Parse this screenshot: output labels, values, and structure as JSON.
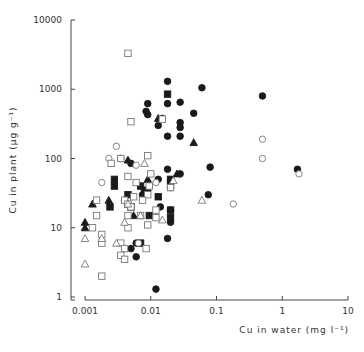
{
  "chart_data": {
    "type": "scatter",
    "title": "",
    "xlabel": "Cu in water (mg l⁻¹)",
    "ylabel": "Cu in plant (μg g⁻¹)",
    "xscale": "log",
    "yscale": "log",
    "xlim": [
      0.001,
      10
    ],
    "ylim": [
      1,
      10000
    ],
    "xticks": [
      "0.001",
      "0.01",
      "0.1",
      "1",
      "10"
    ],
    "yticks": [
      "1",
      "10",
      "100",
      "1000",
      "10000"
    ],
    "grid": false,
    "legend": "none",
    "series": [
      {
        "name": "filled-circle",
        "marker": "circle",
        "filled": true,
        "points": [
          [
            0.018,
            1300
          ],
          [
            0.06,
            1050
          ],
          [
            0.5,
            800
          ],
          [
            0.009,
            620
          ],
          [
            0.018,
            620
          ],
          [
            0.028,
            650
          ],
          [
            0.0085,
            480
          ],
          [
            0.009,
            430
          ],
          [
            0.015,
            380
          ],
          [
            0.028,
            330
          ],
          [
            0.028,
            280
          ],
          [
            0.013,
            300
          ],
          [
            0.018,
            210
          ],
          [
            0.028,
            210
          ],
          [
            0.045,
            450
          ],
          [
            0.0035,
            100
          ],
          [
            0.005,
            85
          ],
          [
            0.018,
            70
          ],
          [
            0.013,
            50
          ],
          [
            0.028,
            60
          ],
          [
            0.08,
            75
          ],
          [
            1.7,
            70
          ],
          [
            0.008,
            35
          ],
          [
            0.004,
            25
          ],
          [
            0.0075,
            30
          ],
          [
            0.075,
            30
          ],
          [
            0.014,
            20
          ],
          [
            0.02,
            18
          ],
          [
            0.02,
            12
          ],
          [
            0.018,
            7
          ],
          [
            0.006,
            6
          ],
          [
            0.005,
            5
          ],
          [
            0.006,
            3.8
          ],
          [
            0.012,
            1.3
          ],
          [
            0.02,
            38
          ],
          [
            0.009,
            35
          ]
        ]
      },
      {
        "name": "filled-square",
        "marker": "square",
        "filled": true,
        "points": [
          [
            0.018,
            850
          ],
          [
            0.0028,
            50
          ],
          [
            0.0028,
            40
          ],
          [
            0.007,
            40
          ],
          [
            0.0045,
            30
          ],
          [
            0.013,
            28
          ],
          [
            0.02,
            50
          ],
          [
            0.02,
            45
          ],
          [
            0.0024,
            20
          ],
          [
            0.005,
            20
          ],
          [
            0.0095,
            15
          ],
          [
            0.02,
            18
          ],
          [
            0.02,
            14
          ],
          [
            0.007,
            6
          ]
        ]
      },
      {
        "name": "filled-triangle",
        "marker": "triangle",
        "filled": true,
        "points": [
          [
            0.013,
            380
          ],
          [
            0.045,
            170
          ],
          [
            0.0045,
            95
          ],
          [
            0.009,
            50
          ],
          [
            0.025,
            60
          ],
          [
            0.0023,
            25
          ],
          [
            0.0013,
            22
          ],
          [
            0.0045,
            22
          ],
          [
            0.0055,
            15
          ],
          [
            0.001,
            12
          ],
          [
            0.001,
            10
          ]
        ]
      },
      {
        "name": "open-circle",
        "marker": "circle",
        "filled": false,
        "points": [
          [
            0.5,
            190
          ],
          [
            0.5,
            100
          ],
          [
            1.8,
            60
          ],
          [
            0.18,
            22
          ],
          [
            0.003,
            150
          ],
          [
            0.0023,
            100
          ],
          [
            0.006,
            80
          ],
          [
            0.0018,
            45
          ],
          [
            0.0065,
            6
          ],
          [
            0.012,
            45
          ]
        ]
      },
      {
        "name": "open-square",
        "marker": "square",
        "filled": false,
        "points": [
          [
            0.0045,
            3300
          ],
          [
            0.015,
            370
          ],
          [
            0.005,
            340
          ],
          [
            0.009,
            110
          ],
          [
            0.0035,
            100
          ],
          [
            0.0025,
            85
          ],
          [
            0.01,
            60
          ],
          [
            0.0045,
            55
          ],
          [
            0.006,
            45
          ],
          [
            0.0095,
            40
          ],
          [
            0.02,
            38
          ],
          [
            0.0055,
            28
          ],
          [
            0.0015,
            25
          ],
          [
            0.004,
            25
          ],
          [
            0.0045,
            22
          ],
          [
            0.005,
            20
          ],
          [
            0.009,
            30
          ],
          [
            0.0075,
            25
          ],
          [
            0.0045,
            15
          ],
          [
            0.007,
            15
          ],
          [
            0.0015,
            15
          ],
          [
            0.012,
            18
          ],
          [
            0.012,
            14
          ],
          [
            0.0045,
            10
          ],
          [
            0.009,
            11
          ],
          [
            0.0013,
            10
          ],
          [
            0.0018,
            8
          ],
          [
            0.0035,
            6
          ],
          [
            0.0018,
            6
          ],
          [
            0.004,
            5
          ],
          [
            0.0085,
            5
          ],
          [
            0.0035,
            4
          ],
          [
            0.004,
            3.5
          ],
          [
            0.0018,
            2
          ]
        ]
      },
      {
        "name": "open-triangle",
        "marker": "triangle",
        "filled": false,
        "points": [
          [
            0.008,
            85
          ],
          [
            0.022,
            48
          ],
          [
            0.0045,
            22
          ],
          [
            0.06,
            25
          ],
          [
            0.015,
            13
          ],
          [
            0.004,
            12
          ],
          [
            0.001,
            7
          ],
          [
            0.0018,
            7
          ],
          [
            0.003,
            6
          ],
          [
            0.001,
            3
          ],
          [
            0.007,
            15
          ]
        ]
      }
    ]
  }
}
